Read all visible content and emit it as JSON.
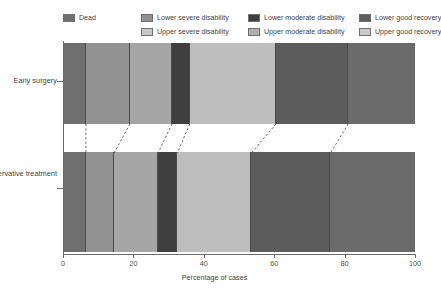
{
  "chart_data": {
    "type": "bar",
    "orientation": "horizontal",
    "stacked": true,
    "normalized_percent": true,
    "title": "",
    "xlabel": "Percentage of cases",
    "ylabel": "",
    "xlim": [
      0,
      100
    ],
    "xticks": [
      0,
      20,
      40,
      60,
      80,
      100
    ],
    "xtick_labels": [
      "0",
      "20",
      "40",
      "60",
      "80",
      "100"
    ],
    "grid": false,
    "legend_position": "top",
    "categories": [
      "Early surgery",
      "Initial conservative treatment"
    ],
    "series": [
      {
        "name": "Dead",
        "color": "#6e6e6e",
        "values": [
          6.5,
          6.5
        ]
      },
      {
        "name": "Lower severe disability",
        "color": "#919191",
        "values": [
          12.5,
          8.0
        ]
      },
      {
        "name": "Upper severe disability",
        "color": "#a6a6a6",
        "values": [
          12.0,
          12.5
        ]
      },
      {
        "name": "Lower moderate disability",
        "color": "#3f3f3f",
        "values": [
          5.0,
          5.5
        ]
      },
      {
        "name": "Upper moderate disability",
        "color": "#bdbdbd",
        "values": [
          24.5,
          21.0
        ]
      },
      {
        "name": "Lower good recovery",
        "color": "#5c5c5c",
        "values": [
          20.5,
          22.5
        ]
      },
      {
        "name": "Upper good recovery",
        "color": "#6b6b6b",
        "values": [
          19.0,
          24.0
        ]
      }
    ],
    "cumulative_boundaries": {
      "Early surgery": [
        0,
        6.5,
        19.0,
        31.0,
        36.0,
        60.5,
        81.0,
        100.0
      ],
      "Initial conservative treatment": [
        0,
        6.5,
        14.5,
        27.0,
        32.5,
        53.5,
        76.0,
        100.0
      ]
    },
    "legend_columns": [
      {
        "left": 0,
        "items": [
          {
            "label": "Dead",
            "color": "#6e6e6e"
          }
        ]
      },
      {
        "left": 78,
        "items": [
          {
            "label": "Lower severe disability",
            "color": "#919191"
          },
          {
            "label": "Upper severe disability",
            "color": "#c6c6c6"
          }
        ]
      },
      {
        "left": 185,
        "items": [
          {
            "label": "Lower moderate disability",
            "color": "#3f3f3f"
          },
          {
            "label": "Upper moderate disability",
            "color": "#b0b0b0"
          }
        ]
      },
      {
        "left": 296,
        "items": [
          {
            "label": "Lower good recovery",
            "color": "#5c5c5c"
          },
          {
            "label": "Upper good recovery",
            "color": "#c9c9c9"
          }
        ]
      }
    ]
  },
  "axis": {
    "x_title": "Percentage of cases",
    "y_labels": {
      "early": "Early surgery",
      "initial": "Initial conservative treatment"
    }
  }
}
